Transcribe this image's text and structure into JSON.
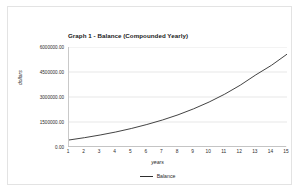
{
  "chart_data": {
    "type": "line",
    "title": "Graph 1 - Balance (Compounded Yearly)",
    "xlabel": "years",
    "ylabel": "dollars",
    "grid": true,
    "legend_position": "bottom-center",
    "xlim": [
      1,
      15
    ],
    "ylim": [
      0,
      6000000
    ],
    "x": [
      1,
      2,
      3,
      4,
      5,
      6,
      7,
      8,
      9,
      10,
      11,
      12,
      13,
      14,
      15
    ],
    "xtick_labels": [
      "1",
      "2",
      "3",
      "4",
      "5",
      "6",
      "7",
      "8",
      "9",
      "10",
      "11",
      "12",
      "13",
      "14",
      "15"
    ],
    "ytick_values": [
      0,
      1500000,
      3000000,
      4500000,
      6000000
    ],
    "ytick_labels": [
      "0.00",
      "1500000.00",
      "3000000.00",
      "4500000.00",
      "6000000.00"
    ],
    "series": [
      {
        "name": "Balance",
        "color": "#2e2e2e",
        "values": [
          420000,
          560000,
          720000,
          900000,
          1110000,
          1350000,
          1620000,
          1930000,
          2290000,
          2700000,
          3170000,
          3710000,
          4330000,
          4900000,
          5570000
        ]
      }
    ]
  },
  "legend": {
    "entries": [
      {
        "label": "Balance"
      }
    ]
  }
}
